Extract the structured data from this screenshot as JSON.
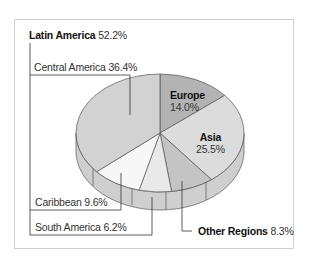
{
  "chart_data": {
    "type": "pie",
    "title": "",
    "style": "3d-exploded-labels",
    "slices": [
      {
        "label": "Europe",
        "value": 14.0,
        "color": "#b3b3b3"
      },
      {
        "label": "Asia",
        "value": 25.5,
        "color": "#dcdcdc"
      },
      {
        "label": "Other Regions",
        "value": 8.3,
        "color": "#c4c4c4"
      },
      {
        "label": "South America",
        "value": 6.2,
        "color": "#e9e9e9"
      },
      {
        "label": "Caribbean",
        "value": 9.6,
        "color": "#f7f7f7"
      },
      {
        "label": "Central America",
        "value": 36.4,
        "color": "#d2d2d2"
      }
    ],
    "groups": [
      {
        "label": "Latin America",
        "value": 52.2,
        "members": [
          "Central America",
          "Caribbean",
          "South America"
        ]
      }
    ]
  },
  "labels": {
    "latin_america": {
      "name": "Latin America",
      "pct": "52.2%"
    },
    "central_america": "Central America 36.4%",
    "europe": {
      "name": "Europe",
      "pct": "14.0%"
    },
    "asia": {
      "name": "Asia",
      "pct": "25.5%"
    },
    "caribbean": "Caribbean 9.6%",
    "south_america": "South America 6.2%",
    "other_regions": {
      "name": "Other Regions",
      "pct": "8.3%"
    }
  }
}
